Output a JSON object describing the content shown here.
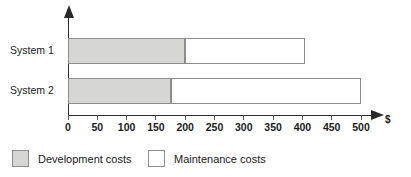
{
  "chart_data": {
    "type": "bar",
    "orientation": "horizontal",
    "stacked": true,
    "title": "",
    "xlabel": "$",
    "ylabel": "",
    "categories": [
      "System 1",
      "System 2"
    ],
    "series": [
      {
        "name": "Development costs",
        "values": [
          200,
          175
        ],
        "color": "#d6d6d4"
      },
      {
        "name": "Maintenance costs",
        "values": [
          205,
          325
        ],
        "color": "#ffffff"
      }
    ],
    "totals": [
      405,
      500
    ],
    "xlim": [
      0,
      500
    ],
    "xticks": [
      0,
      50,
      100,
      150,
      200,
      250,
      300,
      350,
      400,
      450,
      500
    ],
    "xtick_labels": [
      "0",
      "50",
      "100",
      "150",
      "200",
      "250",
      "300",
      "350",
      "400",
      "450",
      "500"
    ],
    "grid": false,
    "legend_position": "bottom-left",
    "axis_arrows": true,
    "border_color": "#8d8d8d",
    "axis_color": "#2b2b2b"
  },
  "axis": {
    "unit_label": "$"
  },
  "legend": {
    "items": [
      {
        "label": "Development costs",
        "swatch": "development-swatch"
      },
      {
        "label": "Maintenance costs",
        "swatch": "maintenance-swatch"
      }
    ]
  }
}
